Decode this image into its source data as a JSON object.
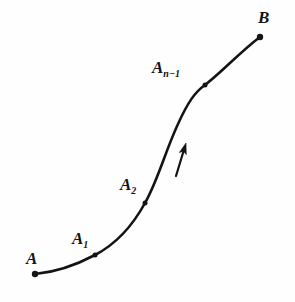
{
  "figure": {
    "background_color": "#fefefe",
    "ink_color": "#141414",
    "width": 295,
    "height": 302
  },
  "labels": {
    "start": {
      "base": "A",
      "sub": ""
    },
    "point1": {
      "base": "A",
      "sub": "1"
    },
    "point2": {
      "base": "A",
      "sub": "2"
    },
    "point_n_minus_1": {
      "base": "A",
      "sub": "n−1"
    },
    "end": {
      "base": "B",
      "sub": ""
    }
  },
  "chart_data": {
    "type": "line",
    "xlabel": "",
    "ylabel": "",
    "grid": false,
    "legend": "none",
    "xlim": [
      0,
      295
    ],
    "ylim": [
      302,
      0
    ],
    "curve_path": "M 35 274 C 58 272, 78 264, 95 255 C 116 244, 133 225, 145 203 C 158 180, 165 152, 178 124 C 188 102, 195 92, 205 85 C 222 72, 240 52, 260 37",
    "marked_points": [
      {
        "name": "A",
        "x": 35,
        "y": 274,
        "dot": "large"
      },
      {
        "name": "A1",
        "x": 95,
        "y": 255,
        "dot": "small"
      },
      {
        "name": "A2",
        "x": 145,
        "y": 203,
        "dot": "small"
      },
      {
        "name": "An-1",
        "x": 205,
        "y": 85,
        "dot": "small"
      },
      {
        "name": "B",
        "x": 260,
        "y": 37,
        "dot": "large"
      }
    ],
    "direction_arrow": {
      "from": [
        176,
        176
      ],
      "to": [
        186,
        143
      ],
      "meaning": "direction of traversal along curve"
    },
    "annotations": [
      "A",
      "A1",
      "A2",
      "An-1",
      "B"
    ]
  }
}
